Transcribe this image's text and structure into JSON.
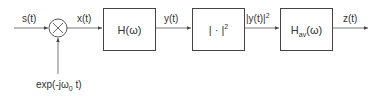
{
  "diagram": {
    "type": "signal-flow-block-diagram",
    "signals": {
      "input": "s(t)",
      "mixed": "x(t)",
      "filtered": "y(t)",
      "squared_base": "|y(t)|",
      "squared_exp": "2",
      "output": "z(t)",
      "oscillator_prefix": "exp(-jω",
      "oscillator_sub": "0",
      "oscillator_suffix": " t)"
    },
    "multiplier": {
      "symbol": "×"
    },
    "blocks": [
      {
        "id": "filter",
        "label": "H(ω)"
      },
      {
        "id": "magnitude-squared",
        "label_base": "| · |",
        "label_exp": "2"
      },
      {
        "id": "averaging-filter",
        "label_base": "H",
        "label_sub": "av",
        "label_suffix": "(ω)"
      }
    ],
    "colors": {
      "stroke": "#444444",
      "text": "#333333",
      "background": "#ffffff"
    }
  }
}
